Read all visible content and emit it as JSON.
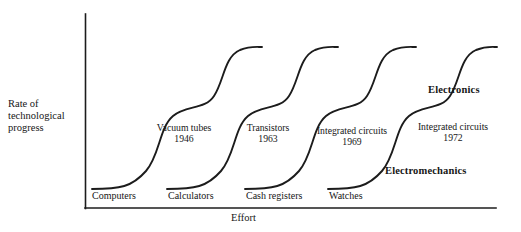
{
  "axes": {
    "y_label_lines": [
      "Rate of",
      "technological",
      "progress"
    ],
    "y_label_text": "Rate of technological progress",
    "x_label": "Effort"
  },
  "base_labels": [
    {
      "text": "Computers"
    },
    {
      "text": "Calculators"
    },
    {
      "text": "Cash registers"
    },
    {
      "text": "Watches"
    }
  ],
  "annotations": [
    {
      "name": "Vacuum tubes",
      "year": "1946"
    },
    {
      "name": "Transistors",
      "year": "1963"
    },
    {
      "name": "Integrated circuits",
      "year": "1969"
    },
    {
      "name": "Integrated circuits",
      "year": "1972"
    }
  ],
  "callouts": {
    "electronics": "Electronics",
    "electromechanics": "Electromechanics"
  },
  "colors": {
    "ink": "#161616",
    "curve": "#1c1c1c",
    "axis": "#1c1c1c",
    "background": "#ffffff"
  },
  "chart_data": {
    "type": "line",
    "xlabel": "Effort",
    "ylabel": "Rate of technological progress",
    "grid": false,
    "legend": null,
    "xlim": [
      0,
      1
    ],
    "ylim": [
      0,
      1
    ],
    "axis_note": "Qualitative axes, no numeric tick labels",
    "series": [
      {
        "name": "Computers",
        "technology": "Vacuum tubes",
        "year": "1946",
        "path": "M 92 189 C 120 189 132 187 146 171 C 160 155 159 128 173 116 C 186 105 205 110 214 96 C 224 81 224 57 240 50 C 250 46 256 47 262 47",
        "start_level": "low",
        "plateau_level": "high"
      },
      {
        "name": "Calculators",
        "technology": "Transistors",
        "year": "1963",
        "path": "M 167 189 C 195 189 207 187 221 171 C 235 155 234 128 248 116 C 261 105 280 110 289 96 C 299 81 299 57 315 50 C 325 46 331 47 338 47",
        "start_level": "low",
        "plateau_level": "high"
      },
      {
        "name": "Cash registers",
        "technology": "Integrated circuits",
        "year": "1969",
        "path": "M 245 189 C 273 189 285 187 299 171 C 313 155 312 128 326 116 C 339 105 358 110 367 96 C 377 81 377 57 393 50 C 403 46 409 47 416 47",
        "start_level": "low",
        "plateau_level": "high"
      },
      {
        "name": "Watches",
        "technology": "Integrated circuits",
        "year": "1972",
        "path": "M 328 189 C 356 189 368 187 382 171 C 396 155 395 128 409 116 C 422 105 441 110 450 96 C 460 81 460 57 476 50 C 486 46 492 47 497 47",
        "start_level": "low",
        "plateau_level": "high"
      }
    ],
    "curve_count": 4,
    "shape": "Each series is an S-curve that ramps from a low plateau (electromechanics) through a mid shoulder to a high plateau (electronics), successively offset to the right."
  }
}
